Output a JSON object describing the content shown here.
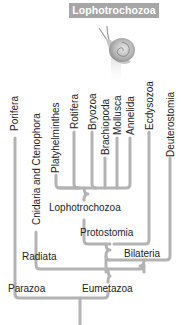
{
  "header": {
    "title": "Lophotrochozoa",
    "badge_color": "#a6a6a6"
  },
  "icon": {
    "name": "snail-icon"
  },
  "taxa": [
    {
      "label": "Porifera"
    },
    {
      "label": "Cnidaria and Ctenophora"
    },
    {
      "label": "Platyhelminthes"
    },
    {
      "label": "Rotifera"
    },
    {
      "label": "Bryozoa"
    },
    {
      "label": "Brachiopoda"
    },
    {
      "label": "Mollusca"
    },
    {
      "label": "Annelida"
    },
    {
      "label": "Ecdysozoa"
    },
    {
      "label": "Deuterostomia"
    }
  ],
  "clades": {
    "lophotrochozoa": "Lophotrochozoa",
    "protostomia": "Protostomia",
    "bilateria": "Bilateria",
    "radiata": "Radiata",
    "eumetazoa": "Eumetazoa",
    "parazoa": "Parazoa"
  },
  "colors": {
    "branch": "#b3b3b3",
    "text": "#222222"
  }
}
